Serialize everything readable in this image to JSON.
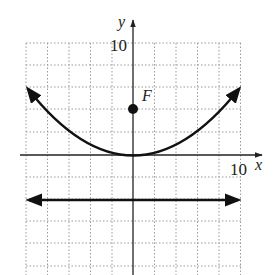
{
  "figure": {
    "type": "parabola-graph",
    "axis_labels": {
      "x": "x",
      "y": "y"
    },
    "tick_labels": {
      "x_max": "10",
      "y_max": "10"
    },
    "focus_label": "F",
    "grid": {
      "x_range": [
        -10,
        10
      ],
      "y_range": [
        -10,
        10
      ],
      "step": 2
    },
    "parabola": {
      "vertex": [
        0,
        0
      ],
      "focus": [
        0,
        3
      ],
      "equation": "x^2 = 12y"
    },
    "directrix": {
      "y": -3
    },
    "colors": {
      "curve": "#111111",
      "grid": "#9a9a9a",
      "axis": "#222222"
    }
  }
}
